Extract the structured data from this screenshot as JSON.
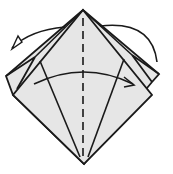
{
  "diagram": {
    "type": "origami-fold-step",
    "colors": {
      "paper": "#e6e6e6",
      "line": "#1a1a1a",
      "background": "#ffffff"
    },
    "elements": {
      "back_layer": "square-base back flap",
      "front_layer": "square-base front flap",
      "valley_fold_line": "vertical center dashed line",
      "fold_lines": "two diagonal lines from bottom point",
      "arrow_front": "fold front flap left to right",
      "arrow_back": "fold back flap right to left (behind)"
    }
  }
}
